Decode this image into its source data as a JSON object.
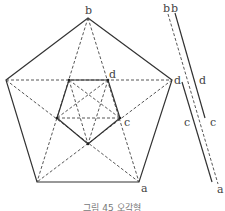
{
  "figure": {
    "caption": "그림 45 오각형",
    "labels": {
      "top_vertex": "b",
      "right_vertex": "d",
      "inner_top_right": "d",
      "inner_right": "c",
      "bottom_right": "a"
    },
    "side_labels": {
      "b1": "b",
      "b2": "b",
      "d1": "d",
      "d2": "d",
      "c1": "c",
      "c2": "c",
      "a": "a"
    }
  }
}
